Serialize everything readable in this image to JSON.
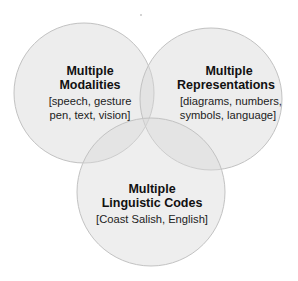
{
  "diagram": {
    "type": "venn",
    "circles": [
      {
        "id": "modalities",
        "title_lines": [
          "Multiple",
          "Modalities"
        ],
        "detail_lines": [
          "[speech, gesture",
          "pen, text, vision]"
        ],
        "cx": 84,
        "cy": 93,
        "r": 70
      },
      {
        "id": "representations",
        "title_lines": [
          "Multiple",
          "Representations"
        ],
        "detail_lines": [
          "[diagrams, numbers,",
          "symbols, language]"
        ],
        "cx": 211,
        "cy": 99,
        "r": 71
      },
      {
        "id": "linguistic-codes",
        "title_lines": [
          "Multiple",
          "Linguistic Codes"
        ],
        "detail_lines": [
          "[Coast Salish, English]"
        ],
        "cx": 151,
        "cy": 192,
        "r": 74
      }
    ],
    "colors": {
      "fill": "#d9d9d9",
      "fill_opacity": "0.45",
      "stroke": "#bdbdbd",
      "text": "#111111"
    }
  }
}
